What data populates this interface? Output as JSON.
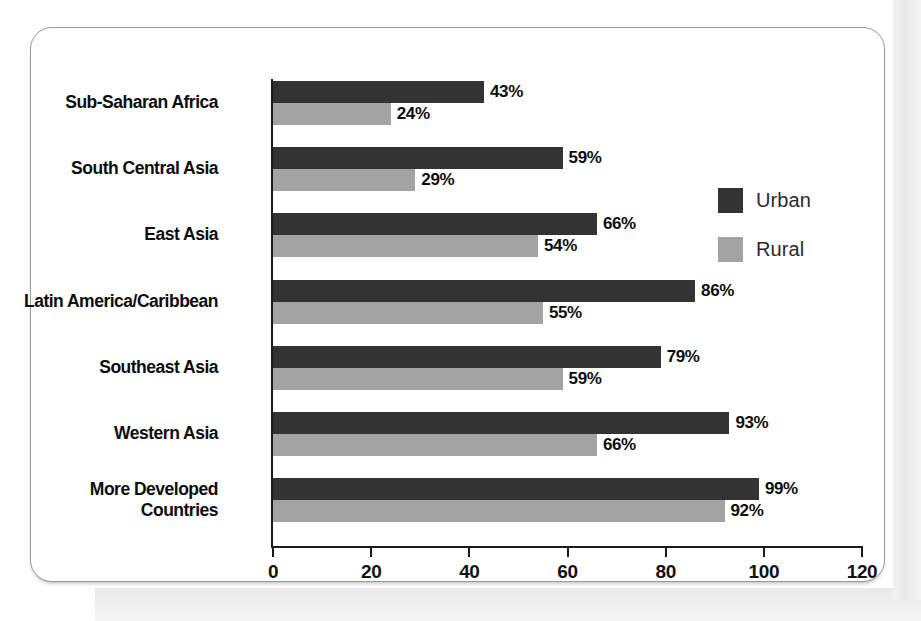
{
  "chart_data": {
    "type": "bar",
    "orientation": "horizontal",
    "title": "",
    "xlabel": "",
    "ylabel": "",
    "xlim": [
      0,
      120
    ],
    "xticks": [
      "0",
      "20",
      "40",
      "60",
      "80",
      "100",
      "120"
    ],
    "grid": false,
    "legend_position": "right",
    "value_suffix": "%",
    "categories": [
      "Sub-Saharan Africa",
      "South Central Asia",
      "East Asia",
      "Latin America/Caribbean",
      "Southeast Asia",
      "Western Asia",
      "More Developed\nCountries"
    ],
    "series": [
      {
        "name": "Urban",
        "color": "#333333",
        "values": [
          43,
          59,
          66,
          86,
          79,
          93,
          99
        ]
      },
      {
        "name": "Rural",
        "color": "#a3a3a3",
        "values": [
          24,
          29,
          54,
          55,
          59,
          66,
          92
        ]
      }
    ],
    "value_labels": {
      "urban": [
        "43%",
        "59%",
        "66%",
        "86%",
        "79%",
        "93%",
        "99%"
      ],
      "rural": [
        "24%",
        "29%",
        "54%",
        "55%",
        "59%",
        "66%",
        "92%"
      ]
    }
  },
  "legend": {
    "items": [
      {
        "label": "Urban",
        "color": "#333333"
      },
      {
        "label": "Rural",
        "color": "#a3a3a3"
      }
    ]
  },
  "colors": {
    "urban": "#333333",
    "rural": "#a3a3a3",
    "axis": "#1a1a1a",
    "text": "#0d0d0d",
    "card_border": "#9a9a9a",
    "background": "#ffffff"
  }
}
